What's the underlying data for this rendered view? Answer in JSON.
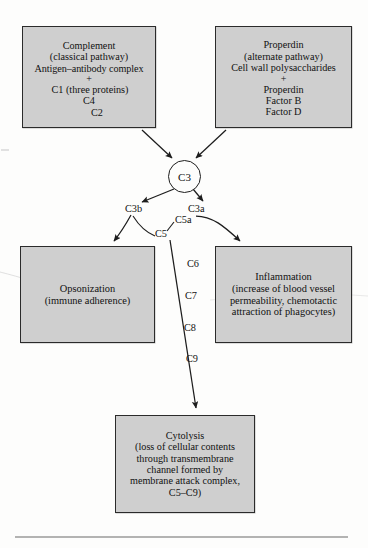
{
  "diagram": {
    "type": "flowchart",
    "background_color": "#fdfdfc",
    "box_fill_color": "#cfcfcf",
    "box_border_color": "#2b2b2b",
    "ink_color": "#3a3a4a"
  },
  "boxes": {
    "complement": {
      "name": "Complement",
      "lines": [
        "Complement",
        "(classical pathway)",
        "Antigen–antibody complex",
        "+",
        "C1 (three proteins)",
        "C4",
        "C2"
      ]
    },
    "properdin": {
      "name": "Properdin",
      "lines": [
        "Properdin",
        "(alternate pathway)",
        "Cell wall polysaccharides",
        "+",
        "Properdin",
        "Factor B",
        "Factor D"
      ]
    },
    "opsonization": {
      "name": "Opsonization",
      "lines": [
        "Opsonization",
        "(immune adherence)"
      ]
    },
    "inflammation": {
      "name": "Inflammation",
      "lines": [
        "Inflammation",
        "(increase of blood vessel",
        "permeability, chemotactic",
        "attraction of phagocytes)"
      ]
    },
    "cytolysis": {
      "name": "Cytolysis",
      "lines": [
        "Cytolysis",
        "(loss of cellular contents",
        "through transmembrane",
        "channel formed by",
        "membrane attack complex,",
        "C5–C9)"
      ]
    }
  },
  "nodes": {
    "c3": "C3"
  },
  "edge_labels": {
    "c3b": "C3b",
    "c3a": "C3a",
    "c5a": "C5a",
    "c5": "C5",
    "c6": "C6",
    "c7": "C7",
    "c8": "C8",
    "c9": "C9"
  },
  "annotations": {
    "circled_terms": [
      "Opsonization",
      "Inflammation"
    ],
    "underlined_terms": [
      "immune adherence",
      "blood vessel",
      "permeability",
      "chemotactic attraction of phagocytes"
    ]
  }
}
